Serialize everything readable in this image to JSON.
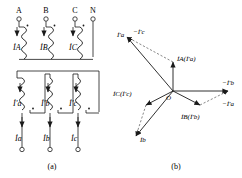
{
  "figure": {
    "panels": [
      {
        "id": "a",
        "caption": "(a)",
        "name": "transformer-connection-diagram",
        "primary_terminals": [
          "A",
          "B",
          "C",
          "N"
        ],
        "primary_currents": [
          "İA",
          "İB",
          "İC"
        ],
        "secondary_winding_currents": [
          "İ'a",
          "İ'b",
          "İ'c"
        ],
        "output_currents": [
          "İa",
          "İb",
          "İc"
        ],
        "polarity_marker": "•"
      },
      {
        "id": "b",
        "caption": "(b)",
        "name": "current-phasor-diagram",
        "origin_label": "O",
        "phasors": [
          {
            "name": "I-A-prime-a",
            "label": "İA(İ'a)",
            "angle_deg": 90,
            "length": 33,
            "style": "solid"
          },
          {
            "name": "I-B-prime-b",
            "label": "İB(İ'b)",
            "angle_deg": -30,
            "length": 33,
            "style": "solid"
          },
          {
            "name": "I-C-prime-c",
            "label": "İC(İ'c)",
            "angle_deg": 210,
            "length": 33,
            "style": "solid"
          },
          {
            "name": "I-a-prime",
            "label": "İ'a",
            "angle_deg": 150,
            "length": 57,
            "style": "solid"
          },
          {
            "name": "I-c",
            "label": "İc",
            "angle_deg": 248,
            "length": 53,
            "style": "solid"
          },
          {
            "name": "I-b",
            "label": "İb",
            "angle_deg": 0,
            "length": 57,
            "style": "solid"
          },
          {
            "name": "neg-I-b-prime",
            "label": "−İ'b",
            "style": "dashed"
          },
          {
            "name": "neg-I-c-prime",
            "label": "−İ'c",
            "style": "dashed"
          },
          {
            "name": "neg-I-a-prime",
            "label": "−İ'a",
            "style": "dashed"
          }
        ]
      }
    ]
  },
  "colors": {
    "ink": "#1a1a1a",
    "paper": "#ffffff",
    "dashed": "#555555"
  }
}
